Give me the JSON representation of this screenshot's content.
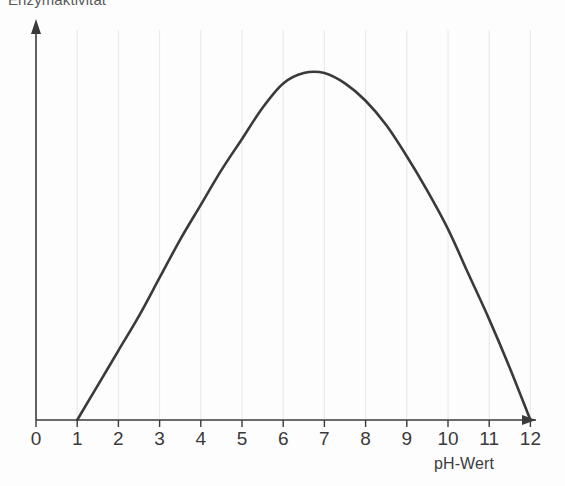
{
  "figure": {
    "background_color": "#fdfdfd",
    "curve_color": "#3a3a3a",
    "axis_color": "#3a3a3a",
    "grid_color": "#e2e2e6"
  },
  "axes": {
    "y_title": "Enzymaktivität",
    "x_title": "pH-Wert",
    "x_tick_labels": [
      "0",
      "1",
      "2",
      "3",
      "4",
      "5",
      "6",
      "7",
      "8",
      "9",
      "10",
      "11",
      "12"
    ]
  },
  "chart_data": {
    "type": "line",
    "title": "",
    "subtitle": "",
    "xlabel": "pH-Wert",
    "ylabel": "Enzymaktivität",
    "xlim": [
      0,
      12.4
    ],
    "ylim": [
      0,
      1.05
    ],
    "grid": true,
    "grid_axis": "x",
    "legend": false,
    "x_ticks": [
      0,
      1,
      2,
      3,
      4,
      5,
      6,
      7,
      8,
      9,
      10,
      11,
      12
    ],
    "x_tick_labels": [
      "0",
      "1",
      "2",
      "3",
      "4",
      "5",
      "6",
      "7",
      "8",
      "9",
      "10",
      "11",
      "12"
    ],
    "y_ticks": [],
    "y_tick_labels": [],
    "series": [
      {
        "name": "Enzymaktivität",
        "color": "#3a3a3a",
        "x": [
          1.0,
          1.5,
          2.0,
          2.5,
          3.0,
          3.5,
          4.0,
          4.5,
          5.0,
          5.5,
          6.0,
          6.5,
          7.0,
          7.5,
          8.0,
          8.5,
          9.0,
          9.5,
          10.0,
          10.5,
          11.0,
          11.5,
          12.0
        ],
        "y": [
          0.0,
          0.1,
          0.2,
          0.3,
          0.41,
          0.52,
          0.62,
          0.72,
          0.81,
          0.9,
          0.97,
          1.0,
          1.0,
          0.97,
          0.92,
          0.85,
          0.76,
          0.66,
          0.55,
          0.42,
          0.29,
          0.15,
          0.0
        ]
      }
    ],
    "annotations": [
      {
        "text": "Optimum",
        "x": 6.75,
        "y": 1.0,
        "visible": false
      }
    ]
  }
}
